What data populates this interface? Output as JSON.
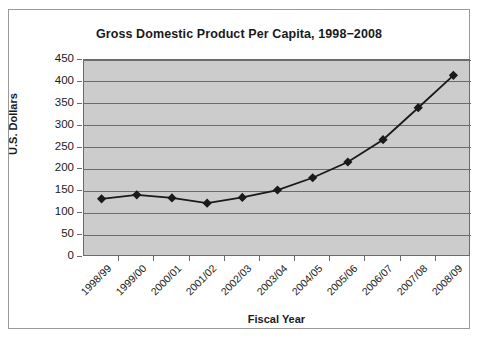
{
  "chart_data": {
    "type": "line",
    "title": "Gross Domestic Product Per Capita, 1998−2008",
    "xlabel": "Fiscal Year",
    "ylabel": "U.S. Dollars",
    "categories": [
      "1998/99",
      "1999/00",
      "2000/01",
      "2001/02",
      "2002/03",
      "2003/04",
      "2004/05",
      "2005/06",
      "2006/07",
      "2007/08",
      "2008/09"
    ],
    "values": [
      133,
      142,
      135,
      123,
      136,
      153,
      181,
      217,
      268,
      341,
      415
    ],
    "series": [
      {
        "name": "GDP per capita",
        "values": [
          133,
          142,
          135,
          123,
          136,
          153,
          181,
          217,
          268,
          341,
          415
        ]
      }
    ],
    "ylim": [
      0,
      450
    ],
    "ytick_labels": [
      "450",
      "400",
      "350",
      "300",
      "250",
      "200",
      "150",
      "100",
      "50",
      "0"
    ],
    "ytick_values": [
      450,
      400,
      350,
      300,
      250,
      200,
      150,
      100,
      50,
      0
    ],
    "grid": "horizontal",
    "legend": "none",
    "marker": "diamond",
    "plot_background": "#cccccc",
    "line_color": "#1a1a1a",
    "marker_color": "#1a1a1a",
    "gridline_color": "#6b6b6b",
    "frame_border_color": "#9a9a9a"
  }
}
